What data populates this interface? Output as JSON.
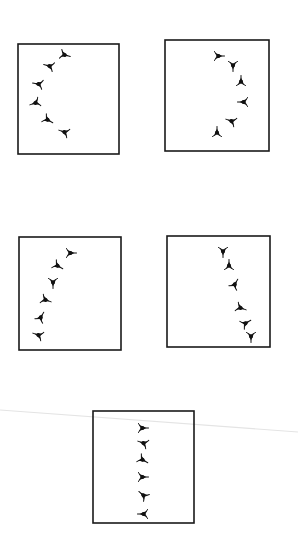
{
  "figure": {
    "width": 298,
    "height": 533,
    "background": "#ffffff",
    "stroke_color": "#1a1a1a",
    "glyph_color": "#111111",
    "scan_line": {
      "x1": 0,
      "y1": 410,
      "x2": 298,
      "y2": 432,
      "color": "#e4e4e4"
    },
    "panels": [
      {
        "id": "panel-arc-left",
        "box": {
          "x1": 18,
          "y1": 44,
          "x2": 119,
          "y2": 154
        },
        "glyphs": [
          {
            "x": 65,
            "y": 55,
            "rot": 15
          },
          {
            "x": 49,
            "y": 66,
            "rot": 195
          },
          {
            "x": 38,
            "y": 84,
            "rot": 190
          },
          {
            "x": 35,
            "y": 103,
            "rot": 160
          },
          {
            "x": 48,
            "y": 120,
            "rot": 30
          },
          {
            "x": 64,
            "y": 132,
            "rot": 200
          }
        ]
      },
      {
        "id": "panel-arc-right",
        "box": {
          "x1": 165,
          "y1": 40,
          "x2": 269,
          "y2": 151
        },
        "glyphs": [
          {
            "x": 219,
            "y": 56,
            "rot": 0
          },
          {
            "x": 233,
            "y": 66,
            "rot": 90
          },
          {
            "x": 241,
            "y": 81,
            "rot": 270
          },
          {
            "x": 243,
            "y": 102,
            "rot": 180
          },
          {
            "x": 231,
            "y": 121,
            "rot": 200
          },
          {
            "x": 217,
            "y": 132,
            "rot": 270
          }
        ]
      },
      {
        "id": "panel-curve-left",
        "box": {
          "x1": 19,
          "y1": 237,
          "x2": 121,
          "y2": 350
        },
        "glyphs": [
          {
            "x": 71,
            "y": 253,
            "rot": 0
          },
          {
            "x": 58,
            "y": 266,
            "rot": 30
          },
          {
            "x": 53,
            "y": 283,
            "rot": 90
          },
          {
            "x": 46,
            "y": 300,
            "rot": 20
          },
          {
            "x": 41,
            "y": 317,
            "rot": 300
          },
          {
            "x": 38,
            "y": 335,
            "rot": 200
          }
        ]
      },
      {
        "id": "panel-curve-right",
        "box": {
          "x1": 167,
          "y1": 236,
          "x2": 270,
          "y2": 347
        },
        "glyphs": [
          {
            "x": 223,
            "y": 252,
            "rot": 90
          },
          {
            "x": 229,
            "y": 265,
            "rot": 270
          },
          {
            "x": 235,
            "y": 284,
            "rot": 300
          },
          {
            "x": 241,
            "y": 308,
            "rot": 20
          },
          {
            "x": 246,
            "y": 323,
            "rot": 330
          },
          {
            "x": 251,
            "y": 337,
            "rot": 90
          }
        ]
      },
      {
        "id": "panel-vertical",
        "box": {
          "x1": 93,
          "y1": 411,
          "x2": 194,
          "y2": 523
        },
        "glyphs": [
          {
            "x": 143,
            "y": 428,
            "rot": 0
          },
          {
            "x": 143,
            "y": 443,
            "rot": 200
          },
          {
            "x": 143,
            "y": 460,
            "rot": 30
          },
          {
            "x": 143,
            "y": 477,
            "rot": 0
          },
          {
            "x": 143,
            "y": 495,
            "rot": 220
          },
          {
            "x": 143,
            "y": 514,
            "rot": 180
          }
        ]
      }
    ]
  }
}
